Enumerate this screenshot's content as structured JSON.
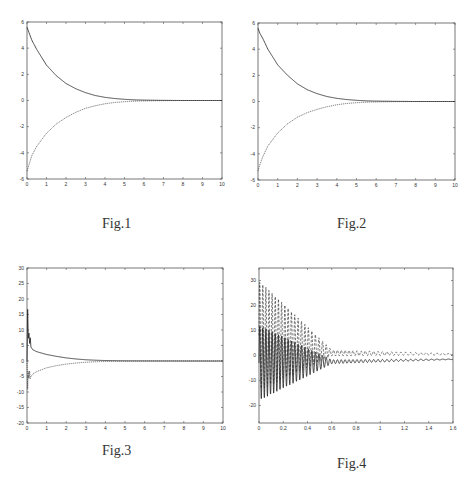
{
  "chart_data": [
    {
      "id": "fig1",
      "type": "line",
      "caption": "Fig.1",
      "title": "",
      "xlabel": "",
      "ylabel": "",
      "xlim": [
        0,
        10
      ],
      "ylim": [
        -6,
        6
      ],
      "xticks": [
        0,
        1,
        2,
        3,
        4,
        5,
        6,
        7,
        8,
        9,
        10
      ],
      "yticks": [
        6,
        4,
        2,
        0,
        -2,
        -4,
        -6
      ],
      "grid": false,
      "legend": null,
      "series": [
        {
          "name": "upper",
          "style": "solid",
          "x": [
            0,
            0.25,
            0.5,
            1,
            1.5,
            2,
            2.5,
            3,
            3.5,
            4,
            4.5,
            5,
            5.5,
            6,
            7,
            8,
            9,
            10
          ],
          "y": [
            5.6,
            4.6,
            3.9,
            2.7,
            1.9,
            1.3,
            0.9,
            0.6,
            0.38,
            0.24,
            0.15,
            0.09,
            0.05,
            0.03,
            0.01,
            0,
            0,
            0
          ]
        },
        {
          "name": "lower",
          "style": "dotted",
          "x": [
            0,
            0.25,
            0.5,
            1,
            1.5,
            2,
            2.5,
            3,
            3.5,
            4,
            4.5,
            5,
            5.5,
            6,
            7,
            8,
            9,
            10
          ],
          "y": [
            -5.4,
            -4.2,
            -3.5,
            -2.5,
            -1.8,
            -1.3,
            -0.9,
            -0.6,
            -0.4,
            -0.25,
            -0.15,
            -0.09,
            -0.05,
            -0.03,
            -0.01,
            0,
            0,
            0
          ]
        }
      ]
    },
    {
      "id": "fig2",
      "type": "line",
      "caption": "Fig.2",
      "title": "",
      "xlabel": "",
      "ylabel": "",
      "xlim": [
        0,
        10
      ],
      "ylim": [
        -6,
        6
      ],
      "xticks": [
        0,
        1,
        2,
        3,
        4,
        5,
        6,
        7,
        8,
        9,
        10
      ],
      "yticks": [
        6,
        4,
        2,
        0,
        -2,
        -4,
        -6
      ],
      "grid": false,
      "legend": null,
      "series": [
        {
          "name": "upper",
          "style": "solid",
          "x": [
            0,
            0.1,
            0.25,
            0.5,
            1,
            1.5,
            2,
            2.5,
            3,
            3.5,
            4,
            4.5,
            5,
            5.5,
            6,
            7,
            8,
            9,
            10
          ],
          "y": [
            5.6,
            5.2,
            4.8,
            4.0,
            2.8,
            2.0,
            1.35,
            0.9,
            0.6,
            0.38,
            0.24,
            0.15,
            0.09,
            0.05,
            0.03,
            0.01,
            0,
            0,
            0
          ]
        },
        {
          "name": "lower",
          "style": "dotted",
          "x": [
            0,
            0.1,
            0.25,
            0.5,
            1,
            1.5,
            2,
            2.5,
            3,
            3.5,
            4,
            4.5,
            5,
            5.5,
            6,
            7,
            8,
            9,
            10
          ],
          "y": [
            -5.3,
            -4.8,
            -4.2,
            -3.4,
            -2.4,
            -1.7,
            -1.2,
            -0.85,
            -0.6,
            -0.4,
            -0.25,
            -0.15,
            -0.09,
            -0.05,
            -0.03,
            -0.01,
            0,
            0,
            0
          ]
        }
      ]
    },
    {
      "id": "fig3",
      "type": "line",
      "caption": "Fig.3",
      "title": "",
      "xlabel": "",
      "ylabel": "",
      "xlim": [
        0,
        10
      ],
      "ylim": [
        -20,
        30
      ],
      "xticks": [
        0,
        1,
        2,
        3,
        4,
        5,
        6,
        7,
        8,
        9,
        10
      ],
      "yticks": [
        30,
        25,
        20,
        15,
        10,
        5,
        0,
        -5,
        -10,
        -15,
        -20
      ],
      "grid": false,
      "legend": null,
      "series": [
        {
          "name": "upper",
          "style": "solid",
          "x": [
            0,
            0.03,
            0.06,
            0.09,
            0.12,
            0.15,
            0.2,
            0.3,
            0.5,
            1,
            1.5,
            2,
            2.5,
            3,
            3.5,
            4,
            5,
            6,
            8,
            10
          ],
          "y": [
            0,
            18,
            6,
            12,
            3,
            9,
            4.5,
            3.6,
            3.0,
            2.1,
            1.5,
            1.0,
            0.65,
            0.4,
            0.25,
            0.15,
            0.05,
            0.02,
            0,
            0
          ]
        },
        {
          "name": "lower",
          "style": "dotted",
          "x": [
            0,
            0.03,
            0.06,
            0.09,
            0.12,
            0.15,
            0.2,
            0.3,
            0.5,
            1,
            1.5,
            2,
            2.5,
            3,
            3.5,
            4,
            5,
            6,
            8,
            10
          ],
          "y": [
            0,
            -10,
            -2,
            -8,
            -1,
            -6,
            -5,
            -4.2,
            -3.4,
            -2.2,
            -1.5,
            -1.0,
            -0.65,
            -0.4,
            -0.25,
            -0.15,
            -0.05,
            -0.02,
            0,
            0
          ]
        }
      ]
    },
    {
      "id": "fig4",
      "type": "line",
      "caption": "Fig.4",
      "title": "",
      "xlabel": "",
      "ylabel": "",
      "xlim": [
        0,
        1.6
      ],
      "ylim": [
        -27,
        35
      ],
      "xticks": [
        0,
        0.2,
        0.4,
        0.6,
        0.8,
        1,
        1.2,
        1.4,
        1.6
      ],
      "xtick_labels": [
        "0",
        "0.2",
        "0.4",
        "0.6",
        "0.8",
        "1",
        "1.2",
        "1.4",
        "1.6"
      ],
      "yticks": [
        30,
        20,
        10,
        0,
        -10,
        -20
      ],
      "grid": false,
      "legend": null,
      "series": [
        {
          "name": "dashed-oscillation",
          "style": "dashed",
          "envelope": {
            "center": [
              8,
              1,
              0.5
            ],
            "amp": [
              22,
              1.2,
              0.2
            ],
            "decay_x": [
              0,
              0.6,
              1.6
            ]
          },
          "freq": 40
        },
        {
          "name": "solid-oscillation",
          "style": "solid",
          "envelope": {
            "center": [
              -3,
              -2.5,
              -1.5
            ],
            "amp": [
              15,
              0.8,
              0.1
            ],
            "decay_x": [
              0,
              0.6,
              1.6
            ]
          },
          "freq": 40
        }
      ]
    }
  ],
  "figures": {
    "fig1": {
      "caption": "Fig.1"
    },
    "fig2": {
      "caption": "Fig.2"
    },
    "fig3": {
      "caption": "Fig.3"
    },
    "fig4": {
      "caption": "Fig.4"
    }
  }
}
